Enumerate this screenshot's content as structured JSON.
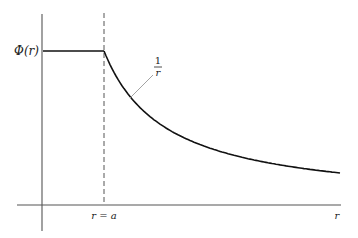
{
  "figure": {
    "y_axis_label": "Φ(r)",
    "x_axis_label": "r",
    "boundary_label": "r = a",
    "curve_annotation": {
      "numerator": "1",
      "denominator": "r"
    },
    "colors": {
      "axis": "#555555",
      "curve": "#111111",
      "dashed": "#555555",
      "leader": "#999999",
      "text": "#222222"
    }
  },
  "chart_data": {
    "type": "line",
    "title": "",
    "xlabel": "r",
    "ylabel": "Φ(r)",
    "annotations": [
      "r = a",
      "1/r"
    ],
    "regions": [
      {
        "name": "inside",
        "range": "0 ≤ r ≤ a",
        "behavior": "constant",
        "value": "Φ(a)"
      },
      {
        "name": "outside",
        "range": "r ≥ a",
        "behavior": "proportional to 1/r"
      }
    ],
    "x_relative_to_a": [
      0,
      0.5,
      1.0,
      1.5,
      2.0,
      2.5,
      3.0,
      3.5,
      4.0,
      4.8
    ],
    "y_relative_to_max": [
      1.0,
      1.0,
      1.0,
      0.667,
      0.5,
      0.4,
      0.333,
      0.286,
      0.25,
      0.208
    ],
    "grid": false,
    "legend": "none"
  }
}
